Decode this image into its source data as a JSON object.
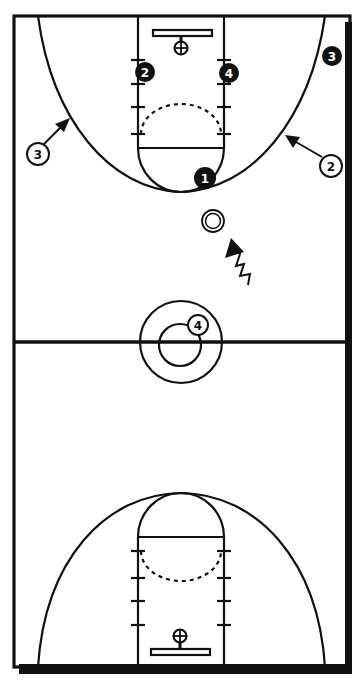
{
  "diagram": {
    "type": "basketball-full-court-play",
    "colors": {
      "ink": "#111111",
      "background": "#ffffff"
    },
    "offense_players": [
      {
        "id": "offense-1",
        "label": "1",
        "x": 205,
        "y": 178
      },
      {
        "id": "offense-2",
        "label": "2",
        "x": 145,
        "y": 72
      },
      {
        "id": "offense-3",
        "label": "3",
        "x": 332,
        "y": 56
      },
      {
        "id": "offense-4",
        "label": "4",
        "x": 229,
        "y": 73
      }
    ],
    "defense_players": [
      {
        "id": "defense-2",
        "label": "2",
        "x": 331,
        "y": 166
      },
      {
        "id": "defense-3",
        "label": "3",
        "x": 38,
        "y": 154
      },
      {
        "id": "defense-4",
        "label": "4",
        "x": 198,
        "y": 325
      }
    ],
    "ball": {
      "x": 213,
      "y": 221
    },
    "annotations": {
      "cut_arrow_defense_3": "arrow toward three-point arc (left wing)",
      "cut_arrow_defense_2": "arrow toward three-point arc (right wing)",
      "dribble_arrow": "zigzag dribble arrow toward ball"
    }
  }
}
